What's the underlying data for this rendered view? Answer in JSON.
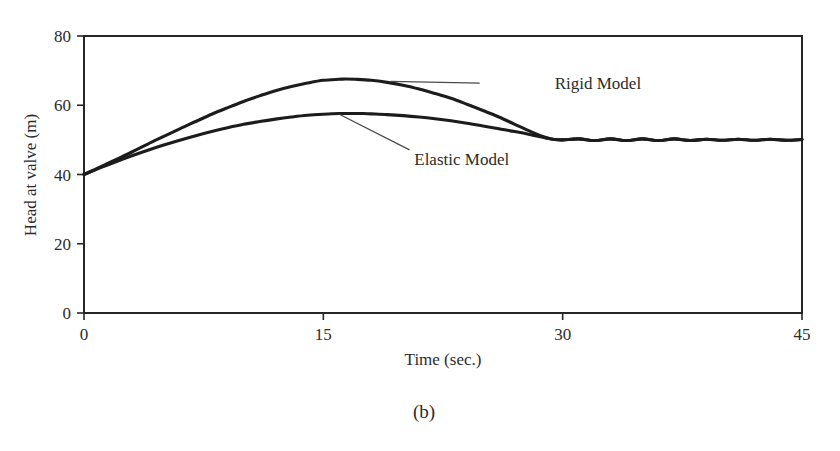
{
  "figure": {
    "caption": "(b)"
  },
  "chart_data": {
    "type": "line",
    "title": "",
    "xlabel": "Time (sec.)",
    "ylabel": "Head at valve (m)",
    "xlim": [
      0,
      45
    ],
    "ylim": [
      0,
      80
    ],
    "xticks": [
      0,
      15,
      30,
      45
    ],
    "yticks": [
      0,
      20,
      40,
      60,
      80
    ],
    "xtick_labels": [
      "0",
      "15",
      "30",
      "45"
    ],
    "ytick_labels": [
      "0",
      "20",
      "40",
      "60",
      "80"
    ],
    "grid": false,
    "legend_position": "annotations-on-plot",
    "annotations": [
      {
        "label": "Rigid Model",
        "text_x": 29.5,
        "text_y": 66.3,
        "leader_from_x": 19.2,
        "leader_from_y": 66.9,
        "leader_to_x": 24.8,
        "leader_to_y": 66.4
      },
      {
        "label": "Elastic Model",
        "text_x": 20.7,
        "text_y": 44.5,
        "leader_from_x": 16.0,
        "leader_from_y": 57.4,
        "leader_to_x": 20.4,
        "leader_to_y": 47.1
      }
    ],
    "series": [
      {
        "name": "Rigid Model",
        "x": [
          0,
          1,
          2,
          3,
          4,
          5,
          6,
          7,
          8,
          9,
          10,
          11,
          12,
          13,
          14,
          15,
          16,
          16.4,
          17,
          18,
          19,
          20,
          21,
          22,
          23,
          24,
          25,
          26,
          27,
          28,
          29,
          29.5,
          30,
          31,
          32,
          33,
          34,
          35,
          36,
          37,
          38,
          39,
          40,
          41,
          42,
          43,
          44,
          45
        ],
        "y": [
          40.0,
          42.1,
          44.3,
          46.5,
          48.8,
          51.0,
          53.2,
          55.3,
          57.4,
          59.3,
          61.1,
          62.7,
          64.2,
          65.4,
          66.4,
          67.2,
          67.5,
          67.6,
          67.5,
          67.2,
          66.6,
          65.8,
          64.7,
          63.4,
          62.0,
          60.3,
          58.5,
          56.6,
          54.5,
          52.4,
          50.6,
          50.1,
          50.0,
          50.3,
          49.8,
          50.3,
          49.8,
          50.3,
          49.8,
          50.3,
          49.8,
          50.2,
          49.9,
          50.2,
          49.9,
          50.2,
          49.9,
          50.1
        ]
      },
      {
        "name": "Elastic Model",
        "x": [
          0,
          1,
          2,
          3,
          4,
          5,
          6,
          7,
          8,
          9,
          10,
          11,
          12,
          13,
          14,
          15,
          16,
          17,
          17.5,
          18,
          19,
          20,
          21,
          22,
          23,
          24,
          25,
          26,
          27,
          28,
          29,
          29.5,
          30,
          31,
          32,
          33,
          34,
          35,
          36,
          37,
          38,
          39,
          40,
          41,
          42,
          43,
          44,
          45
        ],
        "y": [
          40.0,
          41.9,
          43.7,
          45.4,
          47.0,
          48.5,
          49.9,
          51.2,
          52.4,
          53.5,
          54.5,
          55.3,
          56.0,
          56.6,
          57.1,
          57.4,
          57.6,
          57.6,
          57.6,
          57.5,
          57.3,
          57.0,
          56.6,
          56.1,
          55.5,
          54.8,
          54.0,
          53.2,
          52.4,
          51.5,
          50.5,
          50.1,
          50.0,
          50.3,
          49.8,
          50.3,
          49.8,
          50.3,
          49.8,
          50.3,
          49.8,
          50.2,
          49.9,
          50.2,
          49.9,
          50.2,
          49.9,
          50.1
        ]
      }
    ]
  }
}
